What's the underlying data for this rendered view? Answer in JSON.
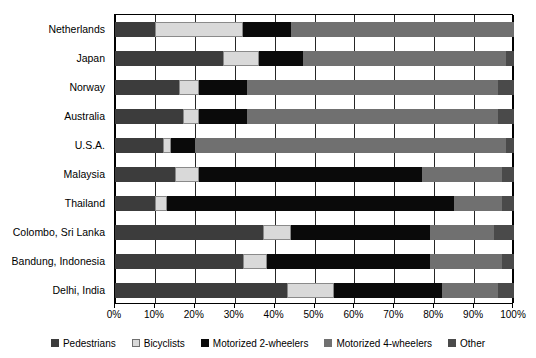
{
  "chart_data": {
    "type": "bar",
    "subtype": "horizontal-stacked-100",
    "title": "",
    "xlabel": "",
    "ylabel": "",
    "xlim": [
      0,
      100
    ],
    "xticks": [
      0,
      10,
      20,
      30,
      40,
      50,
      60,
      70,
      80,
      90,
      100
    ],
    "xticklabels": [
      "0%",
      "10%",
      "20%",
      "30%",
      "40%",
      "50%",
      "60%",
      "70%",
      "80%",
      "90%",
      "100%"
    ],
    "grid": true,
    "grid_axis": "x",
    "legend_position": "bottom",
    "categories": [
      "Netherlands",
      "Japan",
      "Norway",
      "Australia",
      "U.S.A.",
      "Malaysia",
      "Thailand",
      "Colombo, Sri Lanka",
      "Bandung, Indonesia",
      "Delhi, India"
    ],
    "series": [
      {
        "name": "Pedestrians",
        "color": "#3c3c3c",
        "values": [
          10,
          27,
          16,
          17,
          12,
          15,
          10,
          37,
          32,
          43
        ]
      },
      {
        "name": "Bicyclists",
        "color": "#d9d9d9",
        "values": [
          22,
          9,
          5,
          4,
          2,
          6,
          3,
          7,
          6,
          12
        ]
      },
      {
        "name": "Motorized 2-wheelers",
        "color": "#0a0a0a",
        "values": [
          12,
          11,
          12,
          12,
          6,
          56,
          72,
          35,
          41,
          27
        ]
      },
      {
        "name": "Motorized 4-wheelers",
        "color": "#707070",
        "values": [
          56,
          51,
          63,
          63,
          78,
          20,
          12,
          16,
          18,
          14
        ]
      },
      {
        "name": "Other",
        "color": "#4a4a4a",
        "values": [
          0,
          2,
          4,
          4,
          2,
          3,
          3,
          5,
          3,
          4
        ]
      }
    ]
  },
  "legend": {
    "items": [
      {
        "label": "Pedestrians"
      },
      {
        "label": "Bicyclists"
      },
      {
        "label": "Motorized 2-wheelers"
      },
      {
        "label": "Motorized 4-wheelers"
      },
      {
        "label": "Other"
      }
    ]
  },
  "colors": {
    "pedestrians": "#3c3c3c",
    "bicyclists": "#d9d9d9",
    "motorized_2_wheelers": "#0a0a0a",
    "motorized_4_wheelers": "#707070",
    "other": "#4a4a4a",
    "axis": "#000000",
    "background": "#ffffff"
  }
}
